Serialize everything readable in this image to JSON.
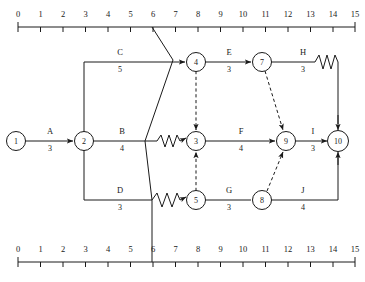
{
  "axes": {
    "top": {
      "ticks": [
        "0",
        "1",
        "2",
        "3",
        "4",
        "5",
        "6",
        "7",
        "8",
        "9",
        "10",
        "11",
        "12",
        "13",
        "14",
        "15"
      ],
      "min": 0,
      "max": 15
    },
    "bottom": {
      "ticks": [
        "0",
        "1",
        "2",
        "3",
        "4",
        "5",
        "6",
        "7",
        "8",
        "9",
        "10",
        "11",
        "12",
        "13",
        "14",
        "15"
      ],
      "min": 0,
      "max": 15
    }
  },
  "nodes": [
    {
      "id": "1",
      "label": "1",
      "x": 16,
      "y": 141
    },
    {
      "id": "2",
      "label": "2",
      "x": 84,
      "y": 141
    },
    {
      "id": "3",
      "label": "3",
      "x": 196,
      "y": 141
    },
    {
      "id": "4",
      "label": "4",
      "x": 196,
      "y": 62
    },
    {
      "id": "5",
      "label": "5",
      "x": 196,
      "y": 200
    },
    {
      "id": "7",
      "label": "7",
      "x": 262,
      "y": 62
    },
    {
      "id": "8",
      "label": "8",
      "x": 262,
      "y": 200
    },
    {
      "id": "9",
      "label": "9",
      "x": 286,
      "y": 141
    },
    {
      "id": "10",
      "label": "10",
      "x": 338,
      "y": 141
    }
  ],
  "activities": [
    {
      "id": "A",
      "name": "A",
      "duration": "3",
      "from": "1",
      "to": "2",
      "label_x": 50,
      "label_y": 134,
      "dur_x": 50,
      "dur_y": 150
    },
    {
      "id": "B",
      "name": "B",
      "duration": "4",
      "from": "2",
      "to": "3",
      "label_x": 122,
      "label_y": 134,
      "dur_x": 122,
      "dur_y": 150
    },
    {
      "id": "C",
      "name": "C",
      "duration": "5",
      "from": "2",
      "to": "4",
      "label_x": 120,
      "label_y": 55,
      "dur_x": 120,
      "dur_y": 71
    },
    {
      "id": "D",
      "name": "D",
      "duration": "3",
      "from": "2",
      "to": "5",
      "label_x": 120,
      "label_y": 193,
      "dur_x": 120,
      "dur_y": 209
    },
    {
      "id": "E",
      "name": "E",
      "duration": "3",
      "from": "4",
      "to": "7",
      "label_x": 229,
      "label_y": 55,
      "dur_x": 229,
      "dur_y": 71
    },
    {
      "id": "F",
      "name": "F",
      "duration": "4",
      "from": "3",
      "to": "9",
      "label_x": 241,
      "label_y": 134,
      "dur_x": 241,
      "dur_y": 150
    },
    {
      "id": "G",
      "name": "G",
      "duration": "3",
      "from": "5",
      "to": "8",
      "label_x": 229,
      "label_y": 193,
      "dur_x": 229,
      "dur_y": 209
    },
    {
      "id": "H",
      "name": "H",
      "duration": "3",
      "from": "7",
      "to": "10",
      "label_x": 303,
      "label_y": 55,
      "dur_x": 303,
      "dur_y": 71
    },
    {
      "id": "I",
      "name": "I",
      "duration": "3",
      "from": "9",
      "to": "10",
      "label_x": 313,
      "label_y": 134,
      "dur_x": 313,
      "dur_y": 150
    },
    {
      "id": "J",
      "name": "J",
      "duration": "4",
      "from": "8",
      "to": "10",
      "label_x": 303,
      "label_y": 193,
      "dur_x": 303,
      "dur_y": 209
    }
  ],
  "dummy_activities": [
    {
      "id": "dummy-4-3",
      "from": "4",
      "to": "3"
    },
    {
      "id": "dummy-5-3",
      "from": "5",
      "to": "3"
    },
    {
      "id": "dummy-7-9",
      "from": "7",
      "to": "9"
    },
    {
      "id": "dummy-8-9",
      "from": "8",
      "to": "9"
    }
  ],
  "time_marker": {
    "value": "6",
    "description": "current-time cut line"
  },
  "colors": {
    "ink": "#1a1a1a",
    "paper": "#ffffff"
  }
}
